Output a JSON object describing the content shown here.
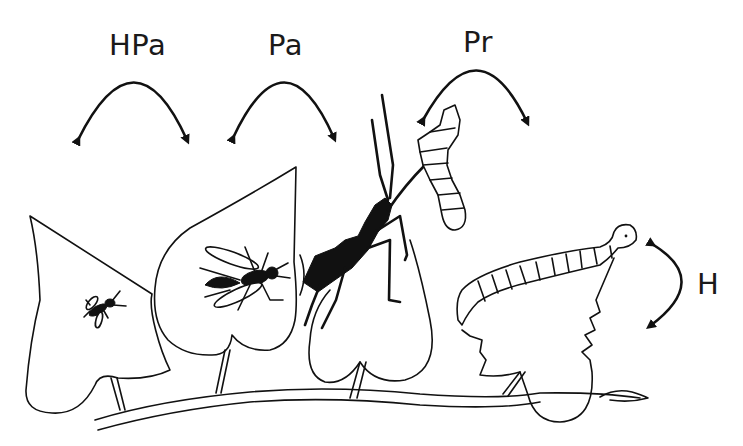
{
  "figure": {
    "labels": {
      "hpa": "HPa",
      "pa": "Pa",
      "pr": "Pr",
      "h": "H"
    },
    "elements": [
      {
        "name": "hyperparasitoid",
        "label": "HPa",
        "depiction": "small wasp on first leaf"
      },
      {
        "name": "parasitoid",
        "label": "Pa",
        "depiction": "wasp with long ovipositor on second leaf"
      },
      {
        "name": "predator",
        "label": "Pr",
        "depiction": "black assassin bug holding larva"
      },
      {
        "name": "herbivore",
        "label": "H",
        "depiction": "caterpillar feeding on leaf edge"
      }
    ],
    "colors": {
      "ink": "#111111",
      "background": "#ffffff"
    }
  }
}
